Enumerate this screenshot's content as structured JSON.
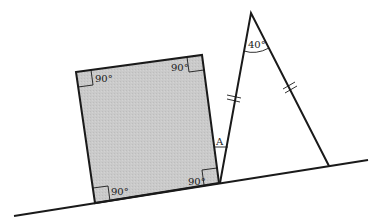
{
  "diagram": {
    "colors": {
      "line": "#1a1a1a",
      "square_fill": "#c9c9c9",
      "background": "#ffffff"
    },
    "square": {
      "corners": {
        "top_left": [
          76,
          72
        ],
        "top_right": [
          202,
          55
        ],
        "bottom_right": [
          219,
          183
        ],
        "bottom_left": [
          95,
          203
        ]
      },
      "angle_labels": {
        "top_left": "90°",
        "top_right": "90°",
        "bottom_left": "90°",
        "bottom_right": "90°"
      }
    },
    "triangle": {
      "apex": [
        251,
        13
      ],
      "base_left": [
        220,
        183
      ],
      "base_right": [
        329,
        166
      ],
      "apex_angle_label": "40°",
      "equal_sides_marks": "double-tick"
    },
    "baseline": {
      "start": [
        14,
        216
      ],
      "end": [
        368,
        160
      ]
    },
    "unknown_angle_label": "A"
  }
}
